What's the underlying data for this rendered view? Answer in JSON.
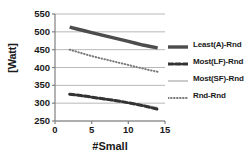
{
  "chart_data": {
    "type": "line",
    "title": "",
    "xlabel": "#Small",
    "ylabel": "[Watt]",
    "xlim": [
      0,
      15
    ],
    "ylim": [
      250,
      550
    ],
    "xticks": [
      0,
      5,
      10,
      15
    ],
    "yticks": [
      250,
      300,
      350,
      400,
      450,
      500,
      550
    ],
    "grid": "horizontal",
    "legend_position": "right",
    "x": [
      2,
      3,
      4,
      5,
      6,
      7,
      8,
      9,
      10,
      11,
      12,
      13,
      14
    ],
    "series": [
      {
        "name": "Least(A)-Rnd",
        "style": "solid-thick",
        "color": "#4d4d4d",
        "values": [
          513,
          508,
          503,
          498,
          493,
          488,
          483,
          478,
          473,
          468,
          463,
          459,
          455
        ]
      },
      {
        "name": "Most(LF)-Rnd",
        "style": "dashed",
        "color": "#333333",
        "values": [
          325,
          323,
          320,
          317,
          314,
          311,
          308,
          305,
          301,
          297,
          293,
          288,
          283
        ]
      },
      {
        "name": "Most(SF)-Rnd",
        "style": "solid-thin",
        "color": "#bfbfbf",
        "values": [
          324,
          321,
          318,
          315,
          312,
          309,
          306,
          303,
          300,
          297,
          294,
          291,
          288
        ]
      },
      {
        "name": "Rnd-Rnd",
        "style": "dotted",
        "color": "#7a7a7a",
        "values": [
          450,
          444,
          438,
          432,
          427,
          422,
          417,
          412,
          407,
          402,
          397,
          392,
          388
        ]
      }
    ]
  },
  "axes": {
    "ylabel": "[Watt]",
    "xlabel": "#Small",
    "ytick_labels": [
      "550",
      "500",
      "450",
      "400",
      "350",
      "300",
      "250"
    ],
    "xtick_labels": [
      "0",
      "5",
      "10",
      "15"
    ]
  },
  "legend": {
    "items": [
      {
        "label": "Least(A)-Rnd",
        "style": "solid-thick",
        "color": "#4d4d4d"
      },
      {
        "label": "Most(LF)-Rnd",
        "style": "dashed",
        "color": "#333333"
      },
      {
        "label": "Most(SF)-Rnd",
        "style": "solid-thin",
        "color": "#bfbfbf"
      },
      {
        "label": "Rnd-Rnd",
        "style": "dotted",
        "color": "#7a7a7a"
      }
    ]
  },
  "colors": {
    "axis": "#808080",
    "grid": "#a6a6a6",
    "text": "#1a1a1a",
    "background": "#ffffff"
  }
}
